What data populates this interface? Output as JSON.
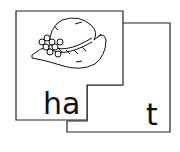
{
  "puzzle": {
    "left_card": {
      "text": "ha",
      "picture": "hat-illustration"
    },
    "right_card": {
      "text": "t"
    },
    "word": "hat"
  }
}
